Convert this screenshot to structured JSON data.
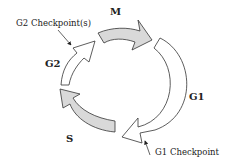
{
  "diagram": {
    "phases": [
      {
        "id": "M",
        "label": "M",
        "fill": "#d9d9d9"
      },
      {
        "id": "G1",
        "label": "G1",
        "fill": "#ffffff"
      },
      {
        "id": "S",
        "label": "S",
        "fill": "#d9d9d9"
      },
      {
        "id": "G2",
        "label": "G2",
        "fill": "#ffffff"
      }
    ],
    "annotations": {
      "g2_checkpoint": "G2 Checkpoint(s)",
      "g1_checkpoint": "G1 Checkpoint"
    },
    "colors": {
      "stroke": "#333333",
      "gray_fill": "#d9d9d9",
      "white_fill": "#ffffff"
    }
  }
}
